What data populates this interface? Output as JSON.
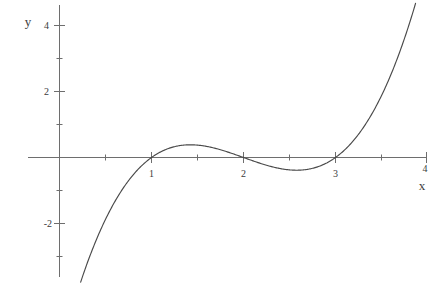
{
  "figure": {
    "width": 440,
    "height": 285,
    "background": "#ffffff",
    "axis_color": "#6e6e6e",
    "curve_color": "#4a4a4a",
    "text_color": "#3b3b3b"
  },
  "chart_data": {
    "type": "line",
    "title": "",
    "xlabel": "x",
    "ylabel": "y",
    "grid": false,
    "legend": null,
    "expression": "y = (x - 1)(x - 2)(x - 3)",
    "xlim": [
      -0.35,
      4.15
    ],
    "ylim": [
      -3.85,
      4.65
    ],
    "x_ticks_major": [
      1,
      2,
      3,
      4
    ],
    "x_tick_labels": [
      "1",
      "2",
      "3",
      "4"
    ],
    "x_ticks_minor": [
      0.5,
      1.5,
      2.5,
      3.5
    ],
    "y_ticks_major": [
      -2,
      2,
      4
    ],
    "y_tick_labels": [
      "-2",
      "2",
      "4"
    ],
    "y_ticks_minor": [
      -3,
      -1,
      1,
      3
    ],
    "roots": [
      1,
      2,
      3
    ],
    "local_max": {
      "x": 1.42,
      "y": 0.38
    },
    "local_min": {
      "x": 2.58,
      "y": -0.38
    },
    "x_domain_drawn": [
      0.23,
      3.87
    ],
    "points": [
      {
        "x": 0.23,
        "y": -3.78
      },
      {
        "x": 0.4,
        "y": -2.81
      },
      {
        "x": 0.6,
        "y": -1.88
      },
      {
        "x": 0.8,
        "y": -1.1
      },
      {
        "x": 1.0,
        "y": 0.0
      },
      {
        "x": 1.2,
        "y": 0.29
      },
      {
        "x": 1.42,
        "y": 0.38
      },
      {
        "x": 1.6,
        "y": 0.34
      },
      {
        "x": 1.8,
        "y": 0.19
      },
      {
        "x": 2.0,
        "y": 0.0
      },
      {
        "x": 2.2,
        "y": -0.19
      },
      {
        "x": 2.4,
        "y": -0.34
      },
      {
        "x": 2.58,
        "y": -0.38
      },
      {
        "x": 2.8,
        "y": -0.29
      },
      {
        "x": 3.0,
        "y": 0.0
      },
      {
        "x": 3.2,
        "y": 0.53
      },
      {
        "x": 3.4,
        "y": 1.34
      },
      {
        "x": 3.6,
        "y": 2.5
      },
      {
        "x": 3.87,
        "y": 4.62
      }
    ]
  },
  "axes": {
    "y_axis_label": "y",
    "x_axis_label": "x"
  }
}
